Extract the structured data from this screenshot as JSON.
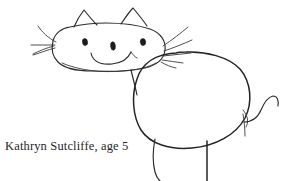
{
  "image": {
    "kind": "scanned-childs-drawing",
    "subject": "cat",
    "background_color": "#ffffff",
    "ink_color": "#2b2b2b",
    "width": 292,
    "height": 181
  },
  "caption": {
    "text": "Kathryn Sutcliffe, age 5",
    "artist_name": "Kathryn Sutcliffe",
    "artist_age": "5",
    "color": "#1f1f1f"
  },
  "drawing": {
    "title": "cat-drawing",
    "parts": [
      {
        "name": "head",
        "label": "Head"
      },
      {
        "name": "left-ear",
        "label": "Left ear"
      },
      {
        "name": "right-ear",
        "label": "Right ear"
      },
      {
        "name": "left-eye",
        "label": "Left eye"
      },
      {
        "name": "middle-eye",
        "label": "Middle eye"
      },
      {
        "name": "right-eye",
        "label": "Right eye"
      },
      {
        "name": "mouth",
        "label": "Smiling mouth"
      },
      {
        "name": "left-whiskers",
        "label": "Left whiskers"
      },
      {
        "name": "right-whiskers",
        "label": "Right whiskers"
      },
      {
        "name": "neck",
        "label": "Neck"
      },
      {
        "name": "body",
        "label": "Body"
      },
      {
        "name": "tail",
        "label": "Tail"
      },
      {
        "name": "front-leg",
        "label": "Front leg"
      },
      {
        "name": "back-leg",
        "label": "Back leg"
      }
    ],
    "eye_count": "3",
    "ear_count": "2",
    "leg_count": "2"
  }
}
